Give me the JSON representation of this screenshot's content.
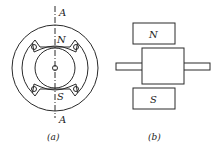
{
  "figure_a": {
    "axis_label_top": "A",
    "axis_label_bottom": "A",
    "pole_north": "N",
    "pole_south": "S",
    "caption": "(a)"
  },
  "figure_b": {
    "pole_north": "N",
    "pole_south": "S",
    "caption": "(b)"
  },
  "colors": {
    "stroke": "#2a2a2a",
    "background": "#ffffff"
  }
}
